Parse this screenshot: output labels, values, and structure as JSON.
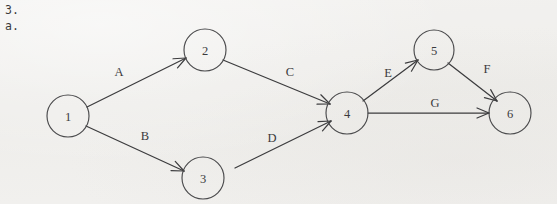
{
  "enumeration": {
    "problem_number": "3.",
    "part_letter": "a."
  },
  "diagram": {
    "type": "directed-graph",
    "stroke_color": "#3c3c3e",
    "background_color": "#f1f0ee",
    "nodes": [
      {
        "id": "1",
        "label": "1",
        "cx": 68,
        "cy": 116,
        "r": 21
      },
      {
        "id": "2",
        "label": "2",
        "cx": 205,
        "cy": 50,
        "r": 21
      },
      {
        "id": "3",
        "label": "3",
        "cx": 203,
        "cy": 178,
        "r": 21
      },
      {
        "id": "4",
        "label": "4",
        "cx": 347,
        "cy": 113,
        "r": 21
      },
      {
        "id": "5",
        "label": "5",
        "cx": 434,
        "cy": 50,
        "r": 20
      },
      {
        "id": "6",
        "label": "6",
        "cx": 510,
        "cy": 113,
        "r": 21
      }
    ],
    "edges": [
      {
        "id": "A",
        "label": "A",
        "from": "1",
        "to": "2",
        "label_x": 119,
        "label_y": 72,
        "x1": 87,
        "y1": 107,
        "x2": 186,
        "y2": 58
      },
      {
        "id": "B",
        "label": "B",
        "from": "1",
        "to": "3",
        "label_x": 145,
        "label_y": 136,
        "x1": 86,
        "y1": 126,
        "x2": 184,
        "y2": 171
      },
      {
        "id": "C",
        "label": "C",
        "from": "2",
        "to": "4",
        "label_x": 290,
        "label_y": 72,
        "x1": 223,
        "y1": 60,
        "x2": 330,
        "y2": 104
      },
      {
        "id": "D",
        "label": "D",
        "from": "3",
        "to": "4",
        "label_x": 272,
        "label_y": 138,
        "x1": 235,
        "y1": 168,
        "x2": 331,
        "y2": 121
      },
      {
        "id": "E",
        "label": "E",
        "from": "4",
        "to": "5",
        "label_x": 388,
        "label_y": 73,
        "x1": 363,
        "y1": 101,
        "x2": 418,
        "y2": 60
      },
      {
        "id": "F",
        "label": "F",
        "from": "5",
        "to": "6",
        "label_x": 487,
        "label_y": 69,
        "x1": 448,
        "y1": 63,
        "x2": 497,
        "y2": 101
      },
      {
        "id": "G",
        "label": "G",
        "from": "4",
        "to": "6",
        "label_x": 435,
        "label_y": 103,
        "x1": 368,
        "y1": 113,
        "x2": 489,
        "y2": 113
      }
    ]
  }
}
